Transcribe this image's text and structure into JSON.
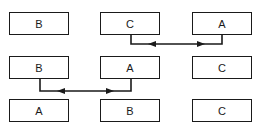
{
  "diagram": {
    "rows": [
      {
        "boxes": [
          "B",
          "C",
          "A"
        ],
        "swap": {
          "from": 1,
          "to": 2
        }
      },
      {
        "boxes": [
          "B",
          "A",
          "C"
        ],
        "swap": {
          "from": 0,
          "to": 1
        }
      },
      {
        "boxes": [
          "A",
          "B",
          "C"
        ]
      }
    ],
    "colors": {
      "line": "#1a1a1a",
      "background": "#ffffff"
    }
  }
}
